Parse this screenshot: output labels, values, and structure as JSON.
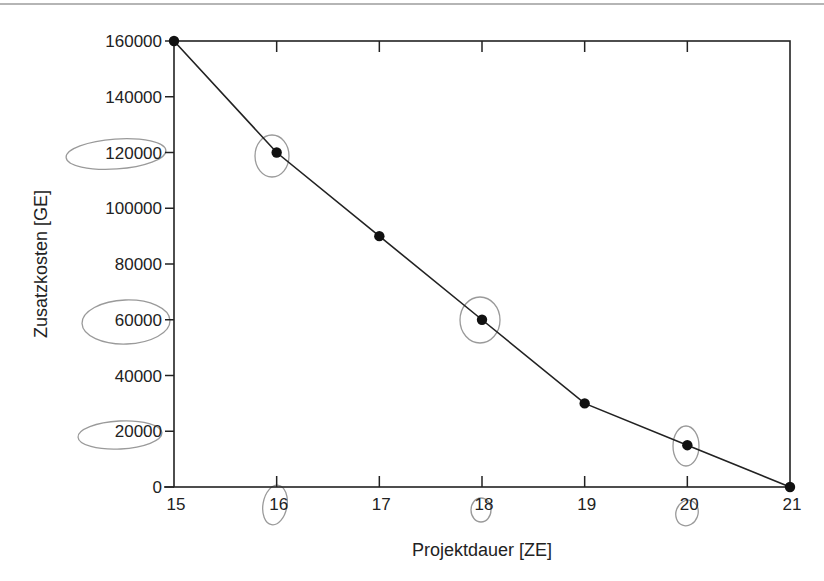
{
  "chart_data": {
    "type": "line",
    "title": "",
    "xlabel": "Projektdauer [ZE]",
    "ylabel": "Zusatzkosten [GE]",
    "x": [
      15,
      16,
      17,
      18,
      19,
      20,
      21
    ],
    "series": [
      {
        "name": "Zusatzkosten",
        "values": [
          160000,
          120000,
          90000,
          60000,
          30000,
          15000,
          0
        ]
      }
    ],
    "xlim": [
      15,
      21
    ],
    "ylim": [
      0,
      160000
    ],
    "xticks": [
      "15",
      "16",
      "17",
      "18",
      "19",
      "20",
      "21"
    ],
    "yticks": [
      "0",
      "20000",
      "40000",
      "60000",
      "80000",
      "100000",
      "120000",
      "140000",
      "160000"
    ],
    "grid": false,
    "legend": null,
    "annotations": "hand-drawn pencil circles around y-ticks 120000, 60000, 20000; x-ticks 16, 18, 20; and points at x=16, 18, 20"
  },
  "colors": {
    "axis": "#222222",
    "line": "#222222",
    "marker": "#111111",
    "pencil": "#9a9a9a",
    "top_rule": "#b5b5b5"
  }
}
